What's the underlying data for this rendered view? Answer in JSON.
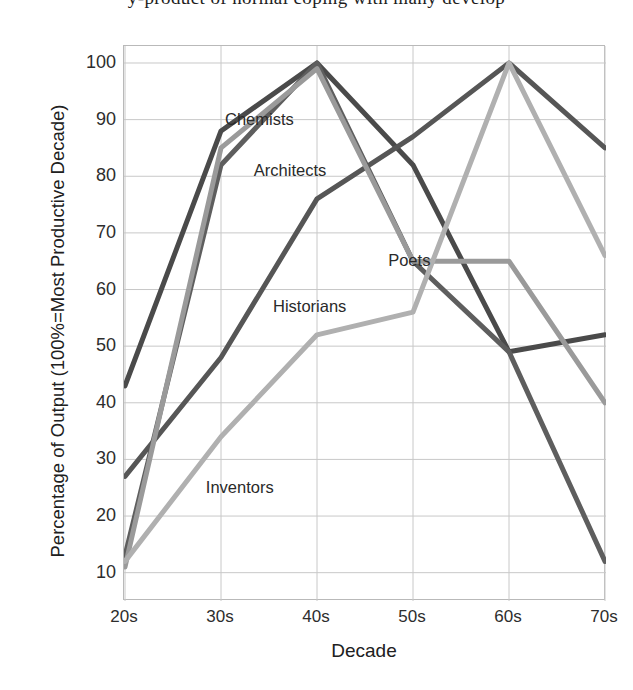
{
  "running_text": "y-product of normal coping with many develop",
  "chart_data": {
    "type": "line",
    "title": "",
    "xlabel": "Decade",
    "ylabel": "Percentage of Output (100%=Most Productive Decade)",
    "categories": [
      "20s",
      "30s",
      "40s",
      "50s",
      "60s",
      "70s"
    ],
    "ylim": [
      5,
      103
    ],
    "yticks": [
      10,
      20,
      30,
      40,
      50,
      60,
      70,
      80,
      90,
      100
    ],
    "grid": true,
    "legend_position": "inline-labels",
    "series": [
      {
        "name": "Chemists",
        "color": "#4a4a4a",
        "width": 5,
        "values": [
          43,
          88,
          100,
          82,
          49,
          52
        ],
        "label_x": "30s",
        "label_y": 90
      },
      {
        "name": "Architects",
        "color": "#5e5e5e",
        "width": 5,
        "values": [
          13,
          82,
          100,
          65,
          49,
          12
        ],
        "label_x": "33s",
        "label_y": 81
      },
      {
        "name": "Historians",
        "color": "#565656",
        "width": 5,
        "values": [
          27,
          48,
          76,
          87,
          100,
          85
        ],
        "label_x": "35s",
        "label_y": 57
      },
      {
        "name": "Poets",
        "color": "#9a9a9a",
        "width": 5,
        "values": [
          11,
          85,
          99,
          65,
          65,
          40
        ],
        "label_x": "47s",
        "label_y": 65
      },
      {
        "name": "Inventors",
        "color": "#b0b0b0",
        "width": 5,
        "values": [
          12,
          34,
          52,
          56,
          100,
          66
        ],
        "label_x": "28s",
        "label_y": 25
      }
    ]
  }
}
